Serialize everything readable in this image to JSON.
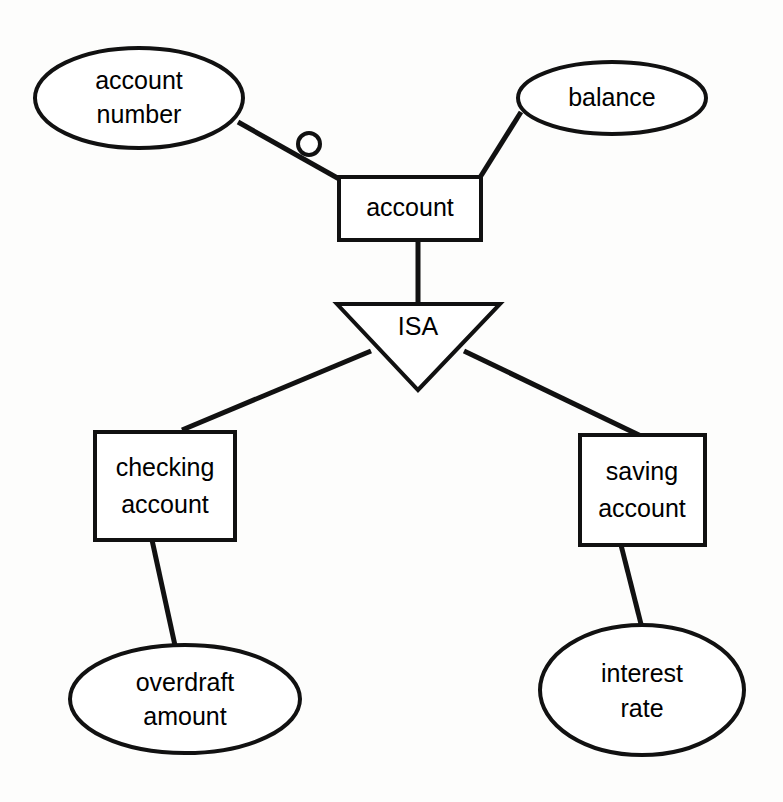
{
  "diagram": {
    "type": "entity-relationship-diagram",
    "notation": "chen",
    "background_color": "#fdfdfc",
    "line_color": "#111111",
    "fill_color": "#ffffff",
    "entities": [
      {
        "id": "account",
        "label": "account",
        "role": "superclass",
        "shape": "rectangle",
        "x": 339,
        "y": 177,
        "width": 142,
        "height": 63
      },
      {
        "id": "checking_account",
        "label_line1": "checking",
        "label_line2": "account",
        "role": "subclass",
        "shape": "rectangle",
        "x": 95,
        "y": 432,
        "width": 140,
        "height": 108
      },
      {
        "id": "saving_account",
        "label_line1": "saving",
        "label_line2": "account",
        "role": "subclass",
        "shape": "rectangle",
        "x": 580,
        "y": 435,
        "width": 125,
        "height": 110
      }
    ],
    "attributes": [
      {
        "id": "account_number",
        "label_line1": "account",
        "label_line2": "number",
        "shape": "ellipse",
        "cx": 139,
        "cy": 98,
        "rx": 104,
        "ry": 50,
        "owner": "account",
        "optional_marker": true
      },
      {
        "id": "balance",
        "label_line1": "balance",
        "label_line2": "",
        "shape": "ellipse",
        "cx": 612,
        "cy": 98,
        "rx": 94,
        "ry": 36,
        "owner": "account",
        "optional_marker": false
      },
      {
        "id": "overdraft_amount",
        "label_line1": "overdraft",
        "label_line2": "amount",
        "shape": "ellipse",
        "cx": 185,
        "cy": 699,
        "rx": 115,
        "ry": 54,
        "owner": "checking_account",
        "optional_marker": false
      },
      {
        "id": "interest_rate",
        "label_line1": "interest",
        "label_line2": "rate",
        "shape": "ellipse",
        "cx": 642,
        "cy": 690,
        "rx": 102,
        "ry": 65,
        "owner": "saving_account",
        "optional_marker": false
      }
    ],
    "isa": {
      "id": "isa_node",
      "label": "ISA",
      "shape": "inverted-triangle",
      "left_x": 337,
      "right_x": 500,
      "top_y": 304,
      "apex_x": 418,
      "apex_y": 390,
      "label_x": 418,
      "label_y": 327,
      "parent": "account",
      "children": [
        "checking_account",
        "saving_account"
      ]
    },
    "connectors": [
      {
        "id": "account-number-to-account",
        "from": "account_number",
        "to": "account",
        "x1": 238,
        "y1": 122,
        "x2": 341,
        "y2": 180
      },
      {
        "id": "balance-to-account",
        "from": "balance",
        "to": "account",
        "x1": 521,
        "y1": 112,
        "x2": 479,
        "y2": 179
      },
      {
        "id": "account-to-isa",
        "from": "account",
        "to": "isa_node",
        "x1": 418,
        "y1": 240,
        "x2": 418,
        "y2": 306
      },
      {
        "id": "isa-to-checking",
        "from": "isa_node",
        "to": "checking_account",
        "x1": 371,
        "y1": 351,
        "x2": 182,
        "y2": 430
      },
      {
        "id": "isa-to-saving",
        "from": "isa_node",
        "to": "saving_account",
        "x1": 464,
        "y1": 351,
        "x2": 641,
        "y2": 436
      },
      {
        "id": "checking-to-overdraft",
        "from": "checking_account",
        "to": "overdraft_amount",
        "x1": 152,
        "y1": 540,
        "x2": 176,
        "y2": 650
      },
      {
        "id": "saving-to-interest",
        "from": "saving_account",
        "to": "interest_rate",
        "x1": 621,
        "y1": 545,
        "x2": 642,
        "y2": 628
      }
    ],
    "optional_marker": {
      "id": "account-number-optional-circle",
      "cx": 309,
      "cy": 144,
      "r": 11
    }
  }
}
